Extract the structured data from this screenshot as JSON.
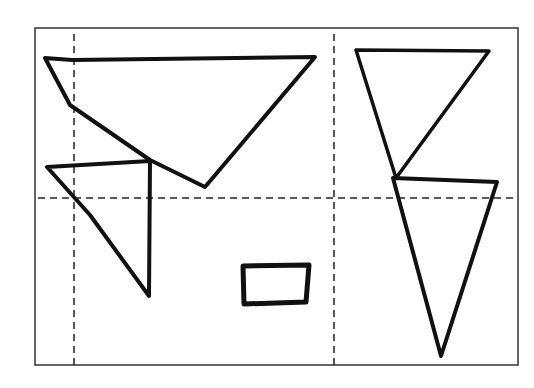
{
  "diagram": {
    "type": "hand-drawn shapes on dashed grid",
    "background": "#ffffff",
    "stroke_color": "#111111",
    "frame": {
      "x": 35,
      "y": 28,
      "width": 216,
      "height": 337,
      "x2": 251,
      "right": 518,
      "bottom": 366
    },
    "grid_lines": {
      "vertical": [
        {
          "x": 74
        },
        {
          "x": 334
        }
      ],
      "horizontal": [
        {
          "y": 198
        }
      ]
    },
    "shapes": [
      {
        "name": "large-inverted-triangle",
        "kind": "triangle",
        "points": "45,58 72,60 315,57 205,187 150,160 70,105"
      },
      {
        "name": "small-left-triangle",
        "kind": "triangle",
        "points": "47,167 150,161 149,296 90,215"
      },
      {
        "name": "small-rectangle",
        "kind": "rectangle",
        "points": "243,266 309,265 306,302 244,304"
      },
      {
        "name": "upper-right-triangle",
        "kind": "triangle",
        "points": "356,50 489,51 396,178"
      },
      {
        "name": "lower-right-triangle",
        "kind": "triangle",
        "points": "393,178 497,182 441,356"
      }
    ]
  }
}
